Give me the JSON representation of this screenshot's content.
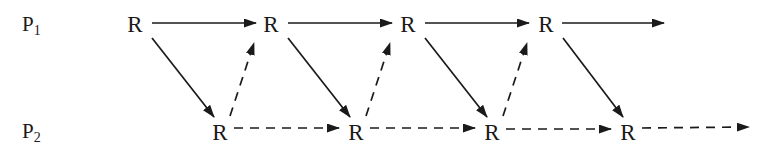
{
  "diagram": {
    "title_semantic": "two-process rendezvous timing diagram",
    "width": 777,
    "height": 157,
    "background": "#ffffff",
    "ink": "#1a1a1a",
    "node_font_size": 23,
    "process_label_font_size": 21,
    "process_label_sub_font_size": 14,
    "stroke_width": 1.7,
    "dash_pattern": "9 7",
    "process_labels": [
      {
        "name": "process-label-p1",
        "base": "P",
        "sub": "1",
        "x": 22,
        "y": 31
      },
      {
        "name": "process-label-p2",
        "base": "P",
        "sub": "2",
        "x": 22,
        "y": 138
      }
    ],
    "nodes": [
      {
        "name": "node-r-p1-1",
        "label": "R",
        "x": 135,
        "y": 24
      },
      {
        "name": "node-r-p1-2",
        "label": "R",
        "x": 271,
        "y": 24
      },
      {
        "name": "node-r-p1-3",
        "label": "R",
        "x": 408,
        "y": 24
      },
      {
        "name": "node-r-p1-4",
        "label": "R",
        "x": 546,
        "y": 24
      },
      {
        "name": "node-r-p2-1",
        "label": "R",
        "x": 220,
        "y": 132
      },
      {
        "name": "node-r-p2-2",
        "label": "R",
        "x": 356,
        "y": 132
      },
      {
        "name": "node-r-p2-3",
        "label": "R",
        "x": 492,
        "y": 132
      },
      {
        "name": "node-r-p2-4",
        "label": "R",
        "x": 628,
        "y": 132
      }
    ],
    "edges": [
      {
        "name": "edge-p1-r1-r2",
        "x1": 152,
        "y1": 23,
        "x2": 256,
        "y2": 23,
        "dashed": false
      },
      {
        "name": "edge-p1-r2-r3",
        "x1": 288,
        "y1": 23,
        "x2": 392,
        "y2": 23,
        "dashed": false
      },
      {
        "name": "edge-p1-r3-r4",
        "x1": 425,
        "y1": 23,
        "x2": 529,
        "y2": 23,
        "dashed": false
      },
      {
        "name": "edge-p1-r4-onward",
        "x1": 562,
        "y1": 23,
        "x2": 664,
        "y2": 23,
        "dashed": false
      },
      {
        "name": "edge-sync-p1r1-p2r1",
        "x1": 152,
        "y1": 38,
        "x2": 214,
        "y2": 117,
        "dashed": false
      },
      {
        "name": "edge-sync-p1r2-p2r2",
        "x1": 288,
        "y1": 38,
        "x2": 350,
        "y2": 117,
        "dashed": false
      },
      {
        "name": "edge-sync-p1r3-p2r3",
        "x1": 425,
        "y1": 38,
        "x2": 487,
        "y2": 117,
        "dashed": false
      },
      {
        "name": "edge-sync-p1r4-p2r4",
        "x1": 563,
        "y1": 38,
        "x2": 623,
        "y2": 117,
        "dashed": false
      },
      {
        "name": "edge-sync-p2r1-p1r2",
        "x1": 230,
        "y1": 116,
        "x2": 254,
        "y2": 43,
        "dashed": true
      },
      {
        "name": "edge-sync-p2r2-p1r3",
        "x1": 366,
        "y1": 116,
        "x2": 390,
        "y2": 43,
        "dashed": true
      },
      {
        "name": "edge-sync-p2r3-p1r4",
        "x1": 503,
        "y1": 116,
        "x2": 527,
        "y2": 43,
        "dashed": true
      },
      {
        "name": "edge-p2-r1-r2",
        "x1": 234,
        "y1": 128,
        "x2": 339,
        "y2": 128,
        "dashed": true
      },
      {
        "name": "edge-p2-r2-r3",
        "x1": 370,
        "y1": 128,
        "x2": 475,
        "y2": 128,
        "dashed": true
      },
      {
        "name": "edge-p2-r3-r4",
        "x1": 506,
        "y1": 129,
        "x2": 611,
        "y2": 129,
        "dashed": true
      },
      {
        "name": "edge-p2-r4-onward",
        "x1": 642,
        "y1": 128,
        "x2": 749,
        "y2": 127,
        "dashed": true
      }
    ]
  }
}
